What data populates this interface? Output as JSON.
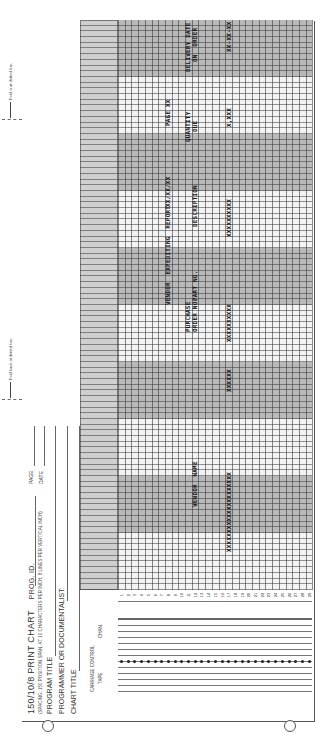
{
  "header": {
    "title": "150/10/8 PRINT CHART",
    "prog_id_label": "PROG. ID.",
    "page_label": "PAGE",
    "date_label": "DATE",
    "spacing_note": "(SPACING: 150 POSITION SPAN, AT 10 CHARACTERS PER INCH, 8 LINES PER VERTICAL INCH)",
    "program_title_label": "PROGRAM TITLE",
    "programmer_label": "PROGRAMMER OR DOCUMENTALIST:",
    "chart_title_label": "CHART TITLE"
  },
  "carriage_control": {
    "label": "CARRIAGE CONTROL",
    "tape_label": "TAPE",
    "chan_label": "CHAN."
  },
  "fold_notes": {
    "fold_back": "Fold back at dotted line.",
    "fold_in": "Fold in at dotted line."
  },
  "grid": {
    "row_count": 29,
    "rows": [
      "1",
      "2",
      "3",
      "4",
      "5",
      "6",
      "7",
      "8",
      "9",
      "10",
      "11",
      "12",
      "13",
      "14",
      "15",
      "16",
      "17",
      "18",
      "19",
      "20",
      "21",
      "22",
      "23",
      "24",
      "25",
      "26",
      "27",
      "28",
      "29"
    ]
  },
  "chart_text": {
    "row8": {
      "report_title": "VENDOR  EXPEDITING  REPORT",
      "date_mask": "XX/XX/XX",
      "page_mask": "PAGE XX"
    },
    "headings_line1": {
      "vendor_name": "VENDOR  NAME",
      "purchase_order_1": "PURCHASE",
      "part_no": "PART NO.",
      "description": "DESCRIPTION",
      "quantity_1": "QUANTITY",
      "delivery_1": "DELIVERY DATE"
    },
    "headings_line2": {
      "purchase_order_2": "ORDER NO.",
      "quantity_2": "DUE",
      "delivery_2": "ON  ORDER"
    },
    "row17": {
      "vendor_name_mask": "XXXXXXXXXXXXXXXXXXXXX",
      "po_mask": "XXXXXX",
      "part_mask": "XXXXXXXXXX",
      "desc_mask": "XXXXXXXXXX",
      "qty_mask": "X,XXX",
      "date_mask": "XX-XX-XX"
    }
  }
}
